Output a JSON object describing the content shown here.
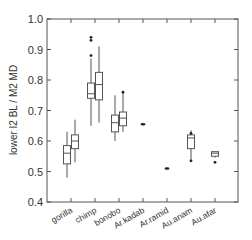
{
  "chart_data": {
    "type": "box",
    "title": "",
    "xlabel": "",
    "ylabel": "lower I2 BL / M2 MD",
    "ylim": [
      0.4,
      1.0
    ],
    "yticks": [
      0.4,
      0.5,
      0.6,
      0.7,
      0.8,
      0.9,
      1.0
    ],
    "ytick_labels": [
      "0.4",
      "0.5",
      "0.6",
      "0.7",
      "0.8",
      "0.9",
      "1.0"
    ],
    "categories": [
      "gorilla",
      "chimp",
      "bonobo",
      "Ar.kadab",
      "Ar.ramid",
      "Au.anam",
      "Au.afar"
    ],
    "grid": false,
    "legend": null,
    "series": [
      {
        "category": "gorilla",
        "boxes": [
          {
            "whisker_low": 0.48,
            "q1": 0.525,
            "median": 0.56,
            "q3": 0.585,
            "whisker_high": 0.63,
            "outliers": []
          },
          {
            "whisker_low": 0.53,
            "q1": 0.575,
            "median": 0.6,
            "q3": 0.62,
            "whisker_high": 0.67,
            "outliers": []
          }
        ]
      },
      {
        "category": "chimp",
        "boxes": [
          {
            "whisker_low": 0.65,
            "q1": 0.74,
            "median": 0.755,
            "q3": 0.79,
            "whisker_high": 0.87,
            "outliers": [
              0.88,
              0.93,
              0.94
            ]
          },
          {
            "whisker_low": 0.66,
            "q1": 0.735,
            "median": 0.785,
            "q3": 0.825,
            "whisker_high": 0.91,
            "outliers": []
          }
        ]
      },
      {
        "category": "bonobo",
        "boxes": [
          {
            "whisker_low": 0.6,
            "q1": 0.63,
            "median": 0.66,
            "q3": 0.685,
            "whisker_high": 0.75,
            "outliers": []
          },
          {
            "whisker_low": 0.63,
            "q1": 0.65,
            "median": 0.675,
            "q3": 0.695,
            "whisker_high": 0.76,
            "outliers": [
              0.76
            ]
          }
        ]
      },
      {
        "category": "Ar.kadab",
        "points": [
          0.655
        ]
      },
      {
        "category": "Ar.ramid",
        "points": [
          0.51
        ]
      },
      {
        "category": "Au.anam",
        "boxes": [
          {
            "whisker_low": 0.535,
            "q1": 0.575,
            "median": 0.61,
            "q3": 0.62,
            "whisker_high": 0.635,
            "outliers": [
              0.535,
              0.625
            ]
          }
        ]
      },
      {
        "category": "Au.afar",
        "boxes": [
          {
            "whisker_low": 0.545,
            "q1": 0.55,
            "median": 0.56,
            "q3": 0.565,
            "whisker_high": 0.565,
            "outliers": [
              0.53
            ]
          }
        ]
      }
    ]
  }
}
